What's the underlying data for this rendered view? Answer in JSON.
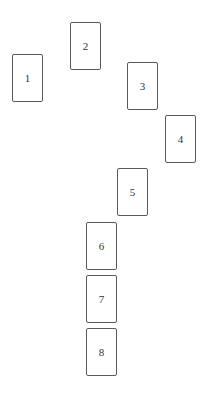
{
  "spread": {
    "cards": [
      {
        "number": "1",
        "x": 12,
        "y": 54
      },
      {
        "number": "2",
        "x": 70,
        "y": 22
      },
      {
        "number": "3",
        "x": 127,
        "y": 62
      },
      {
        "number": "4",
        "x": 165,
        "y": 115
      },
      {
        "number": "5",
        "x": 117,
        "y": 168
      },
      {
        "number": "6",
        "x": 86,
        "y": 222
      },
      {
        "number": "7",
        "x": 86,
        "y": 275
      },
      {
        "number": "8",
        "x": 86,
        "y": 328
      }
    ],
    "card_border_color": "#5a5a5a",
    "background_color": "#ffffff"
  }
}
